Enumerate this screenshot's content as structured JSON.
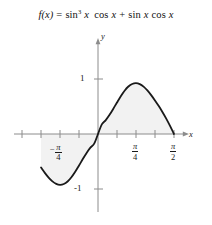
{
  "figure": {
    "name": "calculus-function-plot",
    "background_color": "#ffffff",
    "equation": {
      "lhs": "f(x)",
      "equals": "=",
      "term1_fn": "sin",
      "term1_exp": "3",
      "term1_var": "x",
      "term1_fn2": "cos",
      "term1_var2": "x",
      "plus": "+",
      "term2_fn": "sin",
      "term2_var": "x",
      "term2_fn2": "cos",
      "term2_var2": "x",
      "plain": "f(x) = sin^3 x cos x + sin x cos x"
    },
    "axes": {
      "x_label": "x",
      "y_label": "y",
      "y_tick_pos": "1",
      "y_tick_neg": "-1",
      "x_tick_neg_pi4_num": "π",
      "x_tick_neg_pi4_den": "4",
      "x_tick_neg_pi4_sign": "−",
      "x_tick_pi4_num": "π",
      "x_tick_pi4_den": "4",
      "x_tick_pi2_num": "π",
      "x_tick_pi2_den": "2",
      "axis_color": "#8c8c8c",
      "curve_color": "#1a1a1a",
      "fill_color": "#f2f2f2"
    }
  },
  "chart_data": {
    "type": "line",
    "xlabel": "x",
    "ylabel": "y",
    "xlim": [
      -1.5707963,
      1.5707963
    ],
    "ylim": [
      -1.6,
      1.6
    ],
    "x_tick_labels": [
      "-π/4",
      "π/4",
      "π/2"
    ],
    "x_tick_values": [
      -0.7853982,
      0.7853982,
      1.5707963
    ],
    "y_tick_labels": [
      "1",
      "-1"
    ],
    "y_tick_values": [
      1,
      -1
    ],
    "grid": false,
    "legend": false,
    "fill_between_curve_and_xaxis": true,
    "domain_plotted": [
      -1.1780972,
      1.5707963
    ],
    "series": [
      {
        "name": "f(x) = sin^3 x cos x + sin x cos x",
        "x": [
          -1.1780972,
          -1.0995574,
          -1.0210176,
          -0.9424778,
          -0.863938,
          -0.7853982,
          -0.7068583,
          -0.6283185,
          -0.5497787,
          -0.4712389,
          -0.3926991,
          -0.3141593,
          -0.2356194,
          -0.1570796,
          -0.0785398,
          0.0,
          0.0785398,
          0.1570796,
          0.2356194,
          0.3141593,
          0.3926991,
          0.4712389,
          0.5497787,
          0.6283185,
          0.7068583,
          0.7853982,
          0.863938,
          0.9424778,
          1.0210176,
          1.0995574,
          1.1780972,
          1.2566371,
          1.3351769,
          1.4137167,
          1.4922565,
          1.5707963
        ],
        "y": [
          -0.61,
          -0.7063,
          -0.7921,
          -0.8609,
          -0.9066,
          -0.9239,
          -0.9096,
          -0.8632,
          -0.7871,
          -0.6875,
          -0.5733,
          -0.4552,
          -0.344,
          -0.249,
          -0.176,
          0.0,
          0.176,
          0.249,
          0.344,
          0.4552,
          0.5733,
          0.6875,
          0.7871,
          0.8632,
          0.9096,
          0.9239,
          0.9066,
          0.8609,
          0.7921,
          0.7063,
          0.61,
          0.5075,
          0.3967,
          0.2756,
          0.1434,
          0.0
        ]
      }
    ]
  }
}
